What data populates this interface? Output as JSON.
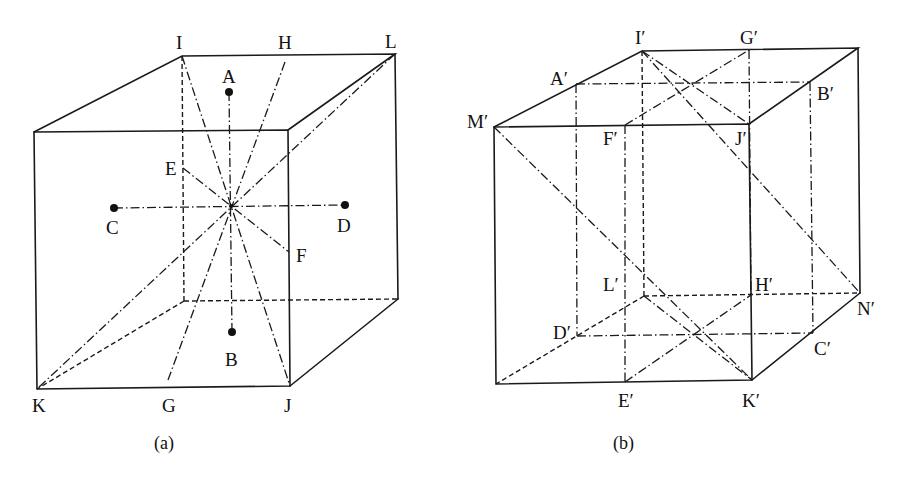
{
  "figure": {
    "panels": [
      {
        "id": "a",
        "caption": "(a)",
        "labels": {
          "I": "I",
          "H": "H",
          "L": "L",
          "A": "A",
          "E": "E",
          "C": "C",
          "D": "D",
          "F": "F",
          "B": "B",
          "K": "K",
          "G": "G",
          "J": "J"
        }
      },
      {
        "id": "b",
        "caption": "(b)",
        "labels": {
          "I": "I′",
          "G": "G′",
          "A": "A′",
          "B": "B′",
          "M": "M′",
          "F": "F′",
          "J": "J′",
          "L": "L′",
          "H": "H′",
          "N": "N′",
          "D": "D′",
          "C": "C′",
          "E": "E′",
          "K": "K′"
        }
      }
    ],
    "colors": {
      "ink": "#1a1a1a",
      "background": "#ffffff"
    }
  }
}
